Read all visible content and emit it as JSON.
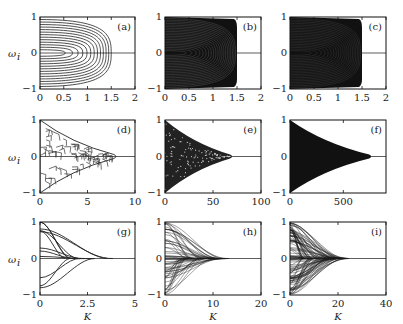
{
  "figure": {
    "ylabel": "ω_i",
    "xlabel": "K",
    "panels": [
      {
        "id": "a",
        "label": "(a)",
        "xticks": [
          "0",
          "0.5",
          "1",
          "1.5",
          "2"
        ],
        "yticks": [
          "1",
          "0",
          "−1"
        ],
        "xmax": 2,
        "edge": 1.55,
        "style": "contours"
      },
      {
        "id": "b",
        "label": "(b)",
        "xticks": [
          "0",
          "0.5",
          "1",
          "1.5",
          "2"
        ],
        "yticks": [
          "1",
          "0",
          " −1"
        ],
        "xmax": 2,
        "edge": 1.5,
        "style": "dense-contours"
      },
      {
        "id": "c",
        "label": "(c)",
        "xticks": [
          "0",
          "0.5",
          "1",
          "1.5",
          "2"
        ],
        "yticks": [
          "1",
          "0",
          "−1"
        ],
        "xmax": 2,
        "edge": 1.5,
        "style": "filled-block"
      },
      {
        "id": "d",
        "label": "(d)",
        "xticks": [
          "0",
          "5",
          "10"
        ],
        "yticks": [
          "1",
          "0",
          "−1"
        ],
        "xmax": 10,
        "edge": 8.2,
        "style": "cell-network"
      },
      {
        "id": "e",
        "label": "(e)",
        "xticks": [
          "0",
          "50",
          "100"
        ],
        "yticks": [
          "1",
          "0",
          "−1"
        ],
        "xmax": 100,
        "edge": 72,
        "style": "dense-triangle"
      },
      {
        "id": "f",
        "label": "(f)",
        "xticks": [
          "0",
          "500"
        ],
        "yticks": [
          "1",
          "0",
          "−1"
        ],
        "xmax": 900,
        "edge": 780,
        "style": "filled-triangle"
      },
      {
        "id": "g",
        "label": "(g)",
        "xticks": [
          "0",
          "2.5",
          "5"
        ],
        "yticks": [
          "1",
          "0",
          "−1"
        ],
        "xmax": 5,
        "edge": 4.5,
        "style": "sparse-branches"
      },
      {
        "id": "h",
        "label": "(h)",
        "xticks": [
          "0",
          "10",
          "20"
        ],
        "yticks": [
          "1",
          "0",
          "−1"
        ],
        "xmax": 20,
        "edge": 14,
        "style": "decay-branches"
      },
      {
        "id": "i",
        "label": "(i)",
        "xticks": [
          "0",
          "20",
          "40"
        ],
        "yticks": [
          "1",
          "0",
          "−1"
        ],
        "xmax": 40,
        "edge": 25,
        "style": "decay-dense"
      }
    ]
  },
  "chart_data": {
    "type": "line",
    "title": "",
    "layout": "3x3 grid of panels (a)-(i)",
    "ylabel": "ω_i",
    "xlabel": "K",
    "grid": false,
    "legend": "none",
    "panels": [
      {
        "label": "(a)",
        "xlim": [
          0,
          2
        ],
        "ylim": [
          -1,
          1
        ],
        "xticks": [
          0,
          0.5,
          1,
          1.5,
          2
        ],
        "yticks": [
          -1,
          0,
          1
        ],
        "description": "Few nested parabolic frequency branches merging to 0 near K≈1.55"
      },
      {
        "label": "(b)",
        "xlim": [
          0,
          2
        ],
        "ylim": [
          -1,
          1
        ],
        "xticks": [
          0,
          0.5,
          1,
          1.5,
          2
        ],
        "yticks": [
          -1,
          0,
          1
        ],
        "description": "Dense branches filling region, synchronization at K≈1.5"
      },
      {
        "label": "(c)",
        "xlim": [
          0,
          2
        ],
        "ylim": [
          -1,
          1
        ],
        "xticks": [
          0,
          0.5,
          1,
          1.5,
          2
        ],
        "yticks": [
          -1,
          0,
          1
        ],
        "description": "Fully dense branches, abrupt sync at K≈1.5"
      },
      {
        "label": "(d)",
        "xlim": [
          0,
          10
        ],
        "ylim": [
          -1,
          1
        ],
        "xticks": [
          0,
          5,
          10
        ],
        "yticks": [
          -1,
          0,
          1
        ],
        "description": "Cellular merging network, envelope shrinking to 0 at K≈8.2"
      },
      {
        "label": "(e)",
        "xlim": [
          0,
          100
        ],
        "ylim": [
          -1,
          1
        ],
        "xticks": [
          0,
          50,
          100
        ],
        "yticks": [
          -1,
          0,
          1
        ],
        "description": "Dense triangular envelope closing at K≈72"
      },
      {
        "label": "(f)",
        "xlim": [
          0,
          900
        ],
        "ylim": [
          -1,
          1
        ],
        "xticks": [
          0,
          500
        ],
        "yticks": [
          -1,
          0,
          1
        ],
        "description": "Filled triangular envelope closing at K≈780"
      },
      {
        "label": "(g)",
        "xlim": [
          0,
          5
        ],
        "ylim": [
          -1,
          1
        ],
        "xticks": [
          0,
          2.5,
          5
        ],
        "yticks": [
          -1,
          0,
          1
        ],
        "description": "Sparse branch merging, final merge near K≈4.5"
      },
      {
        "label": "(h)",
        "xlim": [
          0,
          20
        ],
        "ylim": [
          -1,
          1
        ],
        "xticks": [
          0,
          10,
          20
        ],
        "yticks": [
          -1,
          0,
          1
        ],
        "description": "Dense branches decaying toward 0 by K≈14"
      },
      {
        "label": "(i)",
        "xlim": [
          0,
          40
        ],
        "ylim": [
          -1,
          1
        ],
        "xticks": [
          0,
          20,
          40
        ],
        "yticks": [
          -1,
          0,
          1
        ],
        "description": "Very dense branches decaying toward 0 by K≈25"
      }
    ]
  }
}
